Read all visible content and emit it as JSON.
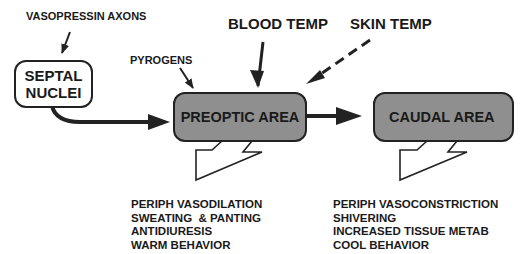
{
  "diagram": {
    "colors": {
      "box_fill": "#8f8f8f",
      "box_white": "#ffffff",
      "stroke": "#222222"
    },
    "inputs": {
      "vasopressin": "VASOPRESSIN AXONS",
      "pyrogens": "PYROGENS",
      "blood_temp": "BLOOD TEMP",
      "skin_temp": "SKIN TEMP"
    },
    "nodes": {
      "septal": {
        "line1": "SEPTAL",
        "line2": "NUCLEI"
      },
      "preoptic": "PREOPTIC AREA",
      "caudal": "CAUDAL AREA"
    },
    "preoptic_outputs": [
      "PERIPH VASODILATION",
      "SWEATING  & PANTING",
      "ANTIDIURESIS",
      "WARM BEHAVIOR"
    ],
    "caudal_outputs": [
      "PERIPH VASOCONSTRICTION",
      "SHIVERING",
      "INCREASED TISSUE METAB",
      "COOL BEHAVIOR"
    ]
  }
}
